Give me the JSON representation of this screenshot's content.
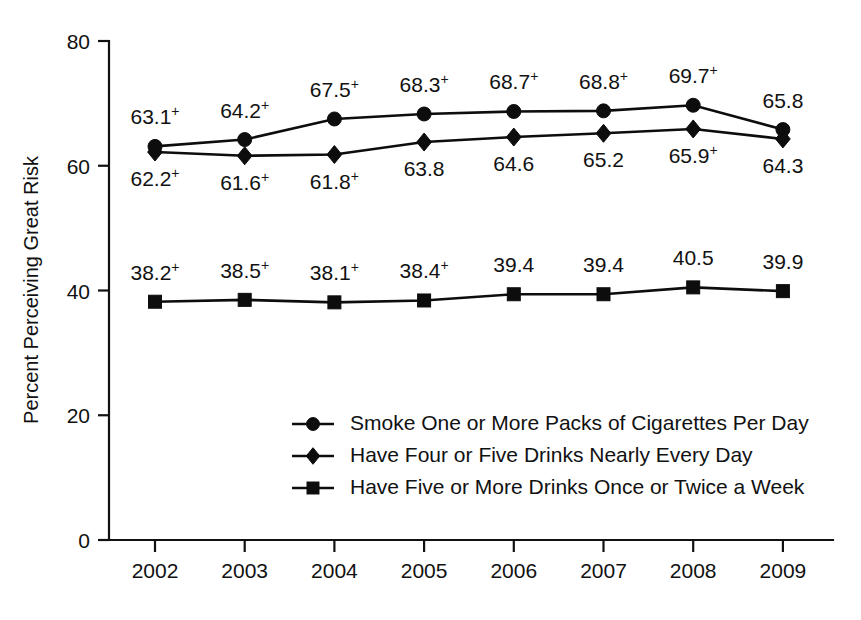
{
  "chart_data": {
    "type": "line",
    "title": "",
    "xlabel": "",
    "ylabel": "Percent Perceiving Great Risk",
    "categories": [
      "2002",
      "2003",
      "2004",
      "2005",
      "2006",
      "2007",
      "2008",
      "2009"
    ],
    "ylim": [
      0,
      80
    ],
    "yticks": [
      "0",
      "20",
      "40",
      "60",
      "80"
    ],
    "ytick_values": [
      0,
      20,
      40,
      60,
      80
    ],
    "grid": false,
    "legend_position": "center-bottom-inside",
    "series": [
      {
        "name": "Smoke One or More Packs of Cigarettes Per Day",
        "marker": "circle",
        "values": [
          63.1,
          64.2,
          67.5,
          68.3,
          68.7,
          68.8,
          69.7,
          65.8
        ],
        "labels": [
          "63.1",
          "64.2",
          "67.5",
          "68.3",
          "68.7",
          "68.8",
          "69.7",
          "65.8"
        ],
        "annotations": [
          "+",
          "+",
          "+",
          "+",
          "+",
          "+",
          "+",
          ""
        ],
        "label_position": "above"
      },
      {
        "name": "Have Four or Five Drinks Nearly Every Day",
        "marker": "diamond",
        "values": [
          62.2,
          61.6,
          61.8,
          63.8,
          64.6,
          65.2,
          65.9,
          64.3
        ],
        "labels": [
          "62.2",
          "61.6",
          "61.8",
          "63.8",
          "64.6",
          "65.2",
          "65.9",
          "64.3"
        ],
        "annotations": [
          "+",
          "+",
          "+",
          "",
          "",
          "",
          "+",
          ""
        ],
        "label_position": "below"
      },
      {
        "name": "Have Five or More Drinks Once or Twice a Week",
        "marker": "square",
        "values": [
          38.2,
          38.5,
          38.1,
          38.4,
          39.4,
          39.4,
          40.5,
          39.9
        ],
        "labels": [
          "38.2",
          "38.5",
          "38.1",
          "38.4",
          "39.4",
          "39.4",
          "40.5",
          "39.9"
        ],
        "annotations": [
          "+",
          "+",
          "+",
          "+",
          "",
          "",
          "",
          ""
        ],
        "label_position": "above"
      }
    ],
    "colors": {
      "ink": "#0d0d0d",
      "background": "#ffffff"
    }
  },
  "legend": {
    "entries": [
      {
        "marker": "circle",
        "label": "Smoke One or More Packs of Cigarettes Per Day"
      },
      {
        "marker": "diamond",
        "label": "Have Four or Five Drinks Nearly Every Day"
      },
      {
        "marker": "square",
        "label": "Have Five or More Drinks Once or Twice a Week"
      }
    ]
  }
}
